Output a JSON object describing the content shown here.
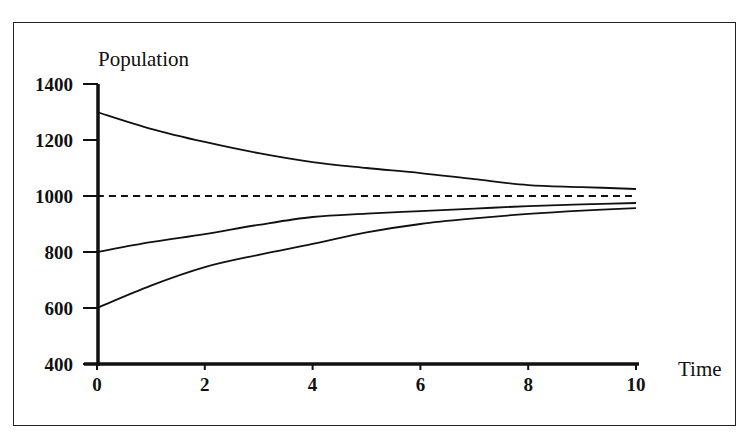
{
  "chart_data": {
    "type": "line",
    "title": "",
    "xlabel": "Time",
    "ylabel": "Population",
    "xlim": [
      0,
      10
    ],
    "ylim": [
      400,
      1400
    ],
    "x_ticks": [
      0,
      2,
      4,
      6,
      8,
      10
    ],
    "y_ticks": [
      400,
      600,
      800,
      1000,
      1200,
      1400
    ],
    "grid": false,
    "legend": null,
    "x": [
      0,
      1,
      2,
      3,
      4,
      5,
      6,
      7,
      8,
      9,
      10
    ],
    "series": [
      {
        "name": "P0 = 1300",
        "style": "solid",
        "values": [
          1300,
          1240,
          1193,
          1153,
          1121,
          1100,
          1082,
          1060,
          1039,
          1032,
          1025
        ]
      },
      {
        "name": "Equilibrium (carrying capacity)",
        "style": "dashed",
        "values": [
          1000,
          1000,
          1000,
          1000,
          1000,
          1000,
          1000,
          1000,
          1000,
          1000,
          1000
        ]
      },
      {
        "name": "P0 = 800",
        "style": "solid",
        "values": [
          800,
          835,
          864,
          897,
          925,
          937,
          946,
          955,
          964,
          970,
          975
        ]
      },
      {
        "name": "P0 = 600",
        "style": "solid",
        "values": [
          600,
          680,
          746,
          790,
          829,
          870,
          900,
          920,
          936,
          948,
          957
        ]
      }
    ]
  },
  "labels": {
    "ylabel": "Population",
    "xlabel": "Time",
    "y_ticks": [
      "400",
      "600",
      "800",
      "1000",
      "1200",
      "1400"
    ],
    "x_ticks": [
      "0",
      "2",
      "4",
      "6",
      "8",
      "10"
    ]
  },
  "colors": {
    "line": "#111111",
    "frame": "#222222",
    "background": "#ffffff"
  }
}
